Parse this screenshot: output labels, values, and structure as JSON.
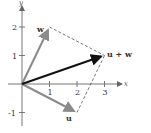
{
  "diagram": {
    "type": "vector-addition-parallelogram",
    "axes": {
      "x_label": "x",
      "y_label": "y",
      "x_ticks": [
        "1",
        "2",
        "3"
      ],
      "y_ticks": [
        "2",
        "1",
        "-1"
      ]
    },
    "vectors": [
      {
        "name": "w",
        "label": "w",
        "from": [
          0,
          0
        ],
        "to": [
          1,
          2
        ],
        "color": "#8a8a8a"
      },
      {
        "name": "u",
        "label": "u",
        "from": [
          0,
          0
        ],
        "to": [
          2,
          -1
        ],
        "color": "#8a8a8a"
      },
      {
        "name": "u+w",
        "label": "u + w",
        "from": [
          0,
          0
        ],
        "to": [
          3,
          1
        ],
        "color": "#111111"
      }
    ],
    "dashed_edges": [
      {
        "from": [
          1,
          2
        ],
        "to": [
          3,
          1
        ]
      },
      {
        "from": [
          2,
          -1
        ],
        "to": [
          3,
          1
        ]
      }
    ]
  }
}
